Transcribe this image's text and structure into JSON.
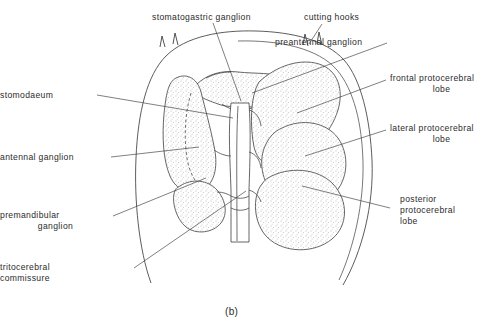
{
  "figure": {
    "caption": "(b)",
    "colors": {
      "background": "#ffffff",
      "outline": "#4a4a4a",
      "leader_line": "#3a3a3a",
      "text": "#2b2b2b",
      "stipple_dot": "#8c8c8c"
    }
  },
  "labels": [
    {
      "id": "stomatogastric-ganglion",
      "text": "stomatogastric ganglion",
      "side": "top",
      "lines": [
        "stomatogastric ganglion"
      ]
    },
    {
      "id": "cutting-hooks",
      "text": "cutting hooks",
      "side": "top",
      "lines": [
        "cutting hooks"
      ]
    },
    {
      "id": "preantennal-ganglion",
      "text": "preantennal ganglion",
      "side": "right",
      "lines": [
        "preantennal ganglion"
      ]
    },
    {
      "id": "frontal-protocerebral-lobe",
      "text": "frontal protocerebral lobe",
      "side": "right",
      "lines": [
        "frontal protocerebral",
        "lobe"
      ]
    },
    {
      "id": "lateral-protocerebral-lobe",
      "text": "lateral protocerebral lobe",
      "side": "right",
      "lines": [
        "lateral protocerebral",
        "lobe"
      ]
    },
    {
      "id": "posterior-protocerebral-lobe",
      "text": "posterior protocerebral lobe",
      "side": "right",
      "lines": [
        "posterior",
        "protocerebral",
        "lobe"
      ]
    },
    {
      "id": "stomodaeum",
      "text": "stomodaeum",
      "side": "left",
      "lines": [
        "stomodaeum"
      ]
    },
    {
      "id": "antennal-ganglion",
      "text": "antennal ganglion",
      "side": "left",
      "lines": [
        "antennal ganglion"
      ]
    },
    {
      "id": "premandibular-ganglion",
      "text": "premandibular ganglion",
      "side": "left",
      "lines": [
        "premandibular",
        "ganglion"
      ]
    },
    {
      "id": "tritocerebral-commissure",
      "text": "tritocerebral commissure",
      "side": "left",
      "lines": [
        "tritocerebral",
        "commissure"
      ]
    }
  ],
  "label_text": {
    "stomatogastric_ganglion": "stomatogastric ganglion",
    "cutting_hooks": "cutting hooks",
    "preantennal_ganglion": "preantennal ganglion",
    "frontal_protocerebral_l1": "frontal protocerebral",
    "frontal_protocerebral_l2": "lobe",
    "lateral_protocerebral_l1": "lateral protocerebral",
    "lateral_protocerebral_l2": "lobe",
    "posterior_protocerebral_l1": "posterior",
    "posterior_protocerebral_l2": "protocerebral",
    "posterior_protocerebral_l3": "lobe",
    "stomodaeum": "stomodaeum",
    "antennal_ganglion": "antennal  ganglion",
    "premandibular_l1": "premandibular",
    "premandibular_l2": "ganglion",
    "tritocerebral_l1": "tritocerebral",
    "tritocerebral_l2": "commissure"
  }
}
